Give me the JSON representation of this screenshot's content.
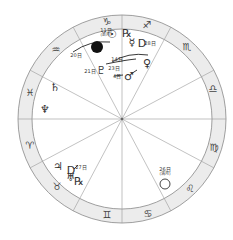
{
  "chart": {
    "center": [
      122,
      119
    ],
    "outer_radius": 104,
    "inner_radius": 90,
    "ring_color": "#ececec",
    "line_color": "#999999",
    "divider_angles": [
      0,
      28,
      62,
      90,
      118,
      152,
      180,
      208,
      242,
      270,
      298,
      332
    ]
  },
  "signs": [
    {
      "name": "capricorn",
      "glyph": "♑",
      "x": 107,
      "y": 22
    },
    {
      "name": "sagittarius",
      "glyph": "♐",
      "x": 147,
      "y": 25
    },
    {
      "name": "scorpio",
      "glyph": "♏",
      "x": 187,
      "y": 47
    },
    {
      "name": "libra",
      "glyph": "♎",
      "x": 213,
      "y": 89
    },
    {
      "name": "virgo",
      "glyph": "♍",
      "x": 214,
      "y": 148
    },
    {
      "name": "leo",
      "glyph": "♌",
      "x": 190,
      "y": 189
    },
    {
      "name": "cancer",
      "glyph": "♋",
      "x": 148,
      "y": 214
    },
    {
      "name": "gemini",
      "glyph": "♊",
      "x": 107,
      "y": 215
    },
    {
      "name": "taurus",
      "glyph": "♉",
      "x": 57,
      "y": 187
    },
    {
      "name": "aries",
      "glyph": "♈",
      "x": 30,
      "y": 146
    },
    {
      "name": "pisces",
      "glyph": "♓",
      "x": 30,
      "y": 93
    },
    {
      "name": "aquarius",
      "glyph": "♒",
      "x": 56,
      "y": 50
    }
  ],
  "planets": [
    {
      "name": "sun",
      "glyph": "☉",
      "x": 112,
      "y": 34
    },
    {
      "name": "pluto",
      "glyph": "♇",
      "x": 101,
      "y": 70
    },
    {
      "name": "mercury",
      "glyph": "☿",
      "x": 132,
      "y": 42
    },
    {
      "name": "mercury-retrograde-mark",
      "glyph": "℞",
      "x": 127,
      "y": 33
    },
    {
      "name": "venus",
      "glyph": "♀",
      "x": 147,
      "y": 63
    },
    {
      "name": "mars",
      "glyph": "♂",
      "x": 129,
      "y": 76
    },
    {
      "name": "saturn",
      "glyph": "♄",
      "x": 55,
      "y": 87
    },
    {
      "name": "neptune",
      "glyph": "♆",
      "x": 45,
      "y": 109
    },
    {
      "name": "jupiter",
      "glyph": "♃",
      "x": 58,
      "y": 166
    },
    {
      "name": "uranus",
      "glyph": "♅",
      "x": 71,
      "y": 177
    },
    {
      "name": "uranus-retrograde-mark",
      "glyph": "℞",
      "x": 79,
      "y": 181
    }
  ],
  "stations": [
    {
      "name": "mercury-station",
      "glyph": "D",
      "x": 142,
      "y": 43
    },
    {
      "name": "uranus-station",
      "glyph": "D",
      "x": 71,
      "y": 170
    }
  ],
  "labels": [
    {
      "name": "new-moon-date",
      "text": "11日",
      "sub": "(新月)",
      "x": 106,
      "y": 32
    },
    {
      "name": "mercury-station-date",
      "text": "28日",
      "x": 150,
      "y": 43
    },
    {
      "name": "sun-ingress-date",
      "text": "20日",
      "x": 76,
      "y": 55
    },
    {
      "name": "pluto-date",
      "text": "21日",
      "x": 90,
      "y": 71
    },
    {
      "name": "venus-ingress-date",
      "text": "14日",
      "x": 117,
      "y": 59
    },
    {
      "name": "mars-date-a",
      "text": "23日",
      "x": 114,
      "y": 68
    },
    {
      "name": "mars-date-b",
      "text": "4日",
      "x": 117,
      "y": 76
    },
    {
      "name": "uranus-station-date",
      "text": "27日",
      "x": 81,
      "y": 167
    },
    {
      "name": "full-moon-date",
      "text": "26日",
      "sub": "(満月)",
      "x": 165,
      "y": 171
    }
  ],
  "moons": {
    "new_moon": {
      "x": 97,
      "y": 47
    },
    "full_moon": {
      "x": 165,
      "y": 184
    }
  }
}
